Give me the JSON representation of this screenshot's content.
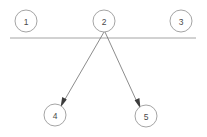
{
  "diagram": {
    "type": "node-link-graph",
    "canvas": {
      "width": 207,
      "height": 137,
      "background": "#ffffff"
    },
    "style": {
      "node_stroke": "#9a9a9a",
      "node_fill": "#ffffff",
      "node_radius": 11,
      "label_color": "#4a4a4a",
      "edge_color": "#6e6e6e",
      "arrowhead_color": "#3c3c3c",
      "separator_color": "#9a9a9a"
    },
    "nodes": [
      {
        "id": "1",
        "label": "1",
        "cx": 26,
        "cy": 21,
        "r": 11,
        "row": "top"
      },
      {
        "id": "2",
        "label": "2",
        "cx": 104,
        "cy": 21,
        "r": 11,
        "row": "top"
      },
      {
        "id": "3",
        "label": "3",
        "cx": 181,
        "cy": 21,
        "r": 11,
        "row": "top"
      },
      {
        "id": "4",
        "label": "4",
        "cx": 55,
        "cy": 115,
        "r": 11,
        "row": "bottom"
      },
      {
        "id": "5",
        "label": "5",
        "cx": 146,
        "cy": 116,
        "r": 11,
        "row": "bottom"
      }
    ],
    "separator": {
      "x1": 10,
      "y1": 38,
      "x2": 196,
      "y2": 38
    },
    "edges": [
      {
        "id": "edge-2-4",
        "from": "2",
        "to": "4",
        "directed": true,
        "x1": 104,
        "y1": 32,
        "x2": 62,
        "y2": 104
      },
      {
        "id": "edge-2-5",
        "from": "2",
        "to": "5",
        "directed": true,
        "x1": 105,
        "y1": 32,
        "x2": 139,
        "y2": 105
      }
    ]
  }
}
